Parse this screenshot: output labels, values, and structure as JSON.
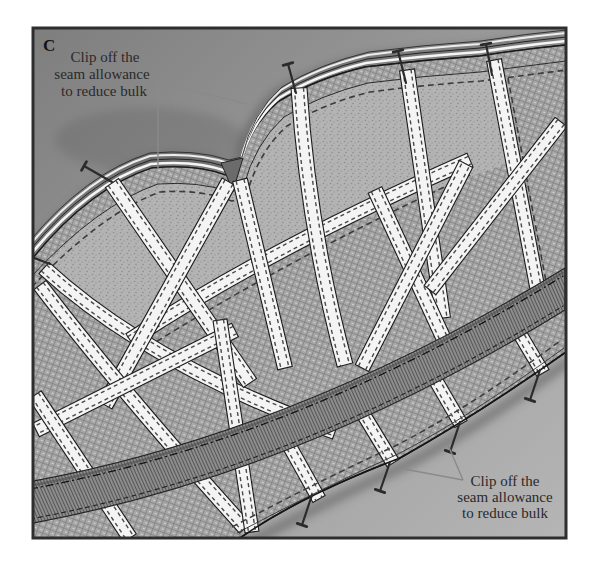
{
  "figure": {
    "panel_label": "C",
    "annotations": {
      "top": {
        "lines": [
          "Clip off the",
          "seam allowance",
          "to reduce bulk"
        ]
      },
      "bottom": {
        "lines": [
          "Clip off the",
          "seam allowance",
          "to reduce bulk"
        ]
      }
    },
    "colors": {
      "page": "#ffffff",
      "frame_border": "#2e2e2e",
      "background_dark": "#7e7e7e",
      "background_mid": "#9a9a9a",
      "background_light": "#b5b5b5",
      "fabric_coutil": "#a7a7a7",
      "fabric_bust": "#b3b3b3",
      "bone_tape": "#f4f4f4",
      "bone_outline": "#1c1c1c",
      "bone_stitch": "#4a4a4a",
      "waist_tape": "#8d8d8d",
      "ink": "#1a1a1a",
      "leader_line": "#8a8a8a",
      "caption_text": "#2a2a2a",
      "pin": "#2b2b2b"
    }
  }
}
